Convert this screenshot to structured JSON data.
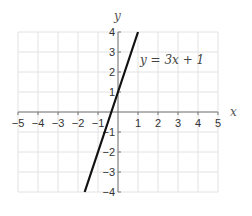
{
  "chart_data": {
    "type": "line",
    "title": "",
    "xlabel": "x",
    "ylabel": "y",
    "xlim": [
      -5,
      5
    ],
    "ylim": [
      -4,
      4
    ],
    "grid": true,
    "x_ticks": [
      "−5",
      "−4",
      "−3",
      "−2",
      "−1",
      "1",
      "2",
      "3",
      "4",
      "5"
    ],
    "y_ticks": [
      "4",
      "3",
      "2",
      "1",
      "−1",
      "−2",
      "−3",
      "−4"
    ],
    "series": [
      {
        "name": "y = 3x + 1",
        "equation": "y = 3x + 1",
        "slope": 3,
        "intercept": 1,
        "x": [
          -1.6667,
          1
        ],
        "y": [
          -4,
          4
        ],
        "color": "#111111"
      }
    ],
    "annotations": [
      {
        "text": "y = 3x + 1",
        "x": 2.3,
        "y": 3
      }
    ]
  },
  "labels": {
    "x_axis": "x",
    "y_axis": "y",
    "equation": "y = 3x + 1"
  }
}
